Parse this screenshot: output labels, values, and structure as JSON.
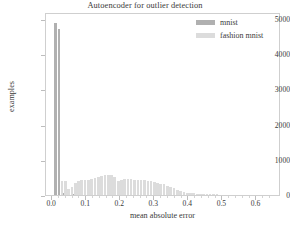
{
  "chart_data": {
    "type": "bar",
    "title": "Autoencoder for outlier detection",
    "xlabel": "mean absolute error",
    "ylabel": "examples",
    "xlim": [
      -0.018,
      0.672
    ],
    "ylim": [
      0,
      5200
    ],
    "xticks": [
      0.0,
      0.1,
      0.2,
      0.3,
      0.4,
      0.5,
      0.6
    ],
    "xtick_labels": [
      "0.0",
      "0.1",
      "0.2",
      "0.3",
      "0.4",
      "0.5",
      "0.6"
    ],
    "yticks": [
      0,
      1000,
      2000,
      3000,
      4000,
      5000
    ],
    "ytick_labels": [
      "0",
      "1000",
      "2000",
      "3000",
      "4000",
      "5000"
    ],
    "grid": false,
    "legend_position": "upper right",
    "bin_width": 0.0095,
    "series": [
      {
        "name": "mnist",
        "color": "#b0b0b0",
        "x": [
          0.01,
          0.02,
          0.03,
          0.039,
          0.049,
          0.059,
          0.068
        ],
        "values": [
          4900,
          4720,
          60,
          25,
          12,
          6,
          3
        ]
      },
      {
        "name": "fashion mnist",
        "color": "#dcdcdc",
        "x": [
          0.029,
          0.039,
          0.049,
          0.058,
          0.068,
          0.078,
          0.087,
          0.097,
          0.107,
          0.116,
          0.126,
          0.136,
          0.145,
          0.155,
          0.165,
          0.174,
          0.184,
          0.194,
          0.203,
          0.213,
          0.223,
          0.232,
          0.242,
          0.252,
          0.261,
          0.271,
          0.281,
          0.29,
          0.3,
          0.31,
          0.319,
          0.329,
          0.339,
          0.348,
          0.358,
          0.368,
          0.377,
          0.387,
          0.397,
          0.406,
          0.416,
          0.426,
          0.435,
          0.445,
          0.455,
          0.464,
          0.474,
          0.484
        ],
        "values": [
          410,
          400,
          180,
          240,
          330,
          390,
          415,
          420,
          440,
          455,
          480,
          500,
          545,
          580,
          570,
          555,
          520,
          400,
          430,
          445,
          450,
          450,
          440,
          430,
          420,
          415,
          400,
          395,
          375,
          350,
          325,
          300,
          270,
          230,
          190,
          150,
          115,
          90,
          70,
          60,
          50,
          35,
          25,
          18,
          12,
          8,
          5,
          3
        ]
      }
    ],
    "legend": [
      {
        "label": "mnist",
        "color": "#b0b0b0"
      },
      {
        "label": "fashion mnist",
        "color": "#dcdcdc"
      }
    ]
  }
}
